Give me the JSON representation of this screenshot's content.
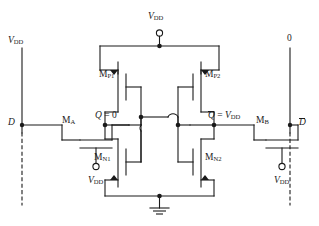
{
  "figure": {
    "kind": "circuit-schematic",
    "ink_color": "#1a1a1a",
    "background": "#ffffff"
  },
  "labels": {
    "supply_left": {
      "symbol": "V",
      "sub": "DD"
    },
    "supply_top": {
      "symbol": "V",
      "sub": "DD"
    },
    "supply_right_value": "0",
    "bitline_left": "D",
    "bitline_right": "D",
    "node_q": {
      "name": "Q",
      "eq": " = 0"
    },
    "node_qbar": {
      "name": "Q",
      "eq": " = ",
      "value_symbol": "V",
      "value_sub": "DD"
    },
    "pass_left": {
      "symbol": "M",
      "sub": "A"
    },
    "pass_right": {
      "symbol": "M",
      "sub": "B"
    },
    "pmos_left": {
      "symbol": "M",
      "sub": "P1"
    },
    "pmos_right": {
      "symbol": "M",
      "sub": "P2"
    },
    "nmos_left": {
      "symbol": "M",
      "sub": "N1"
    },
    "nmos_right": {
      "symbol": "M",
      "sub": "N2"
    },
    "wordline_left": {
      "symbol": "V",
      "sub": "DD"
    },
    "wordline_right": {
      "symbol": "V",
      "sub": "DD"
    }
  },
  "nodes": {
    "q_value": "0",
    "qbar_value": "VDD",
    "ground_label": ""
  }
}
